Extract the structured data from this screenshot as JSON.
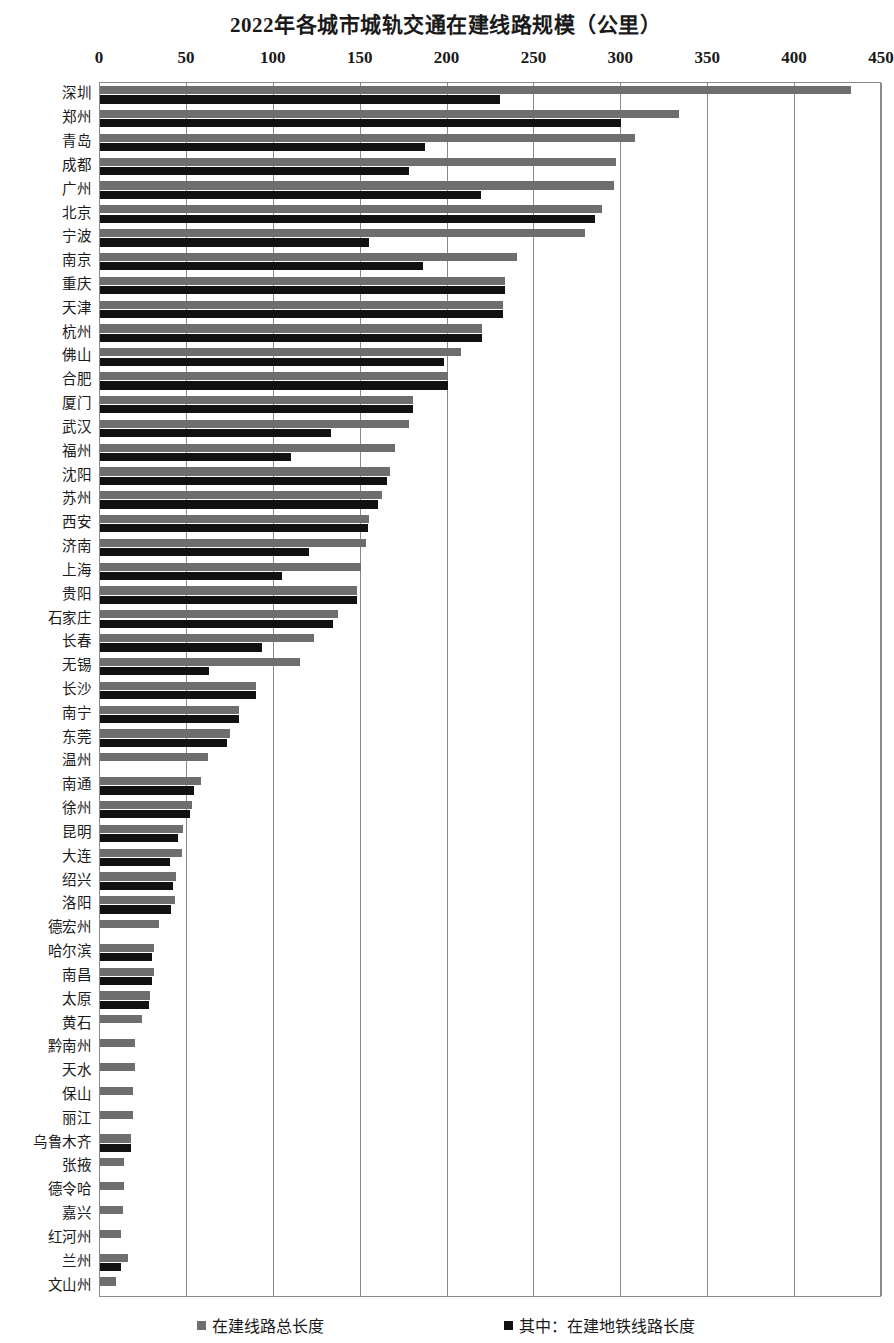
{
  "chart_data": {
    "type": "bar",
    "orientation": "horizontal",
    "title": "2022年各城市城轨交通在建线路规模（公里）",
    "xlabel": "",
    "ylabel": "",
    "xlim": [
      0,
      450
    ],
    "xticks": [
      0,
      50,
      100,
      150,
      200,
      250,
      300,
      350,
      400,
      450
    ],
    "grid": true,
    "legend_position": "bottom",
    "colors": {
      "total": "#6e6e6e",
      "metro": "#111111"
    },
    "categories": [
      "深圳",
      "郑州",
      "青岛",
      "成都",
      "广州",
      "北京",
      "宁波",
      "南京",
      "重庆",
      "天津",
      "杭州",
      "佛山",
      "合肥",
      "厦门",
      "武汉",
      "福州",
      "沈阳",
      "苏州",
      "西安",
      "济南",
      "上海",
      "贵阳",
      "石家庄",
      "长春",
      "无锡",
      "长沙",
      "南宁",
      "东莞",
      "温州",
      "南通",
      "徐州",
      "昆明",
      "大连",
      "绍兴",
      "洛阳",
      "德宏州",
      "哈尔滨",
      "南昌",
      "太原",
      "黄石",
      "黔南州",
      "天水",
      "保山",
      "丽江",
      "乌鲁木齐",
      "张掖",
      "德令哈",
      "嘉兴",
      "红河州",
      "兰州",
      "文山州"
    ],
    "series": [
      {
        "name": "在建线路总长度",
        "values": [
          432,
          333,
          308,
          297,
          296,
          289,
          279,
          240,
          233,
          232,
          220,
          208,
          200,
          180,
          178,
          170,
          167,
          162,
          155,
          153,
          150,
          148,
          137,
          123,
          115,
          90,
          80,
          75,
          62,
          58,
          53,
          48,
          47,
          44,
          43,
          34,
          31,
          31,
          29,
          24,
          20,
          20,
          19,
          19,
          18,
          14,
          14,
          13,
          12,
          16,
          9
        ]
      },
      {
        "name": "其中：在建地铁线路长度",
        "values": [
          230,
          300,
          187,
          178,
          219,
          285,
          155,
          186,
          233,
          232,
          220,
          198,
          200,
          180,
          133,
          110,
          165,
          160,
          154,
          120,
          105,
          148,
          134,
          93,
          63,
          90,
          80,
          73,
          0,
          54,
          52,
          45,
          40,
          42,
          41,
          0,
          30,
          30,
          28,
          0,
          0,
          0,
          0,
          0,
          18,
          0,
          0,
          0,
          0,
          12,
          0
        ]
      }
    ]
  },
  "legend": [
    {
      "label": "在建线路总长度",
      "swatch": "total"
    },
    {
      "label": "其中：在建地铁线路长度",
      "swatch": "metro"
    }
  ]
}
